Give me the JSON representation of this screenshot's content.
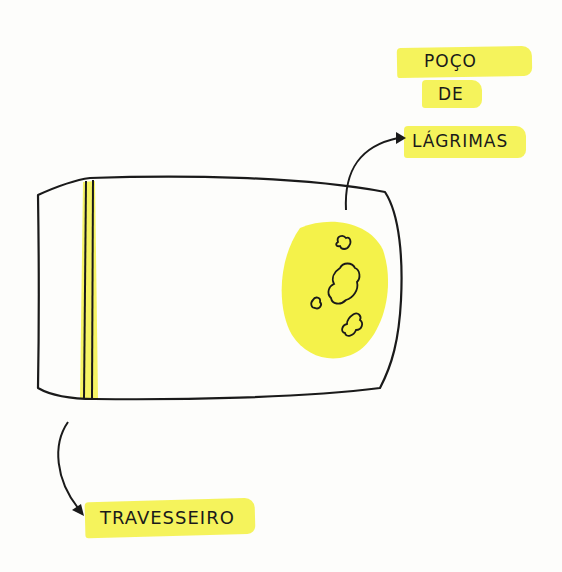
{
  "labels": {
    "well_line1": "POÇO",
    "well_line2": "DE",
    "well_line3": "LÁGRIMAS",
    "pillow": "TRAVESSEIRO"
  },
  "colors": {
    "highlight": "#f4f24a",
    "ink": "#1a1a1a",
    "background": "#fdfdfb"
  },
  "icons": {
    "arrow_to_tears": "curved-arrow-icon",
    "arrow_to_pillow": "curved-arrow-icon"
  }
}
